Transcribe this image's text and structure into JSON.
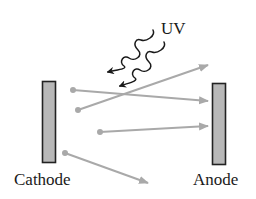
{
  "diagram": {
    "labels": {
      "uv": "UV",
      "cathode": "Cathode",
      "anode": "Anode"
    },
    "colors": {
      "plate_fill": "#b8b8b8",
      "plate_stroke": "#222222",
      "electron": "#a9a9a9",
      "photon": "#1a1a1a",
      "text": "#1a1a1a"
    },
    "electrons": [
      {
        "from": [
          73,
          90
        ],
        "to": [
          208,
          101
        ]
      },
      {
        "from": [
          78,
          110
        ],
        "to": [
          208,
          65
        ]
      },
      {
        "from": [
          100,
          132
        ],
        "to": [
          208,
          126
        ]
      },
      {
        "from": [
          65,
          153
        ],
        "to": [
          148,
          183
        ]
      }
    ],
    "photons": [
      {
        "from": [
          153,
          30
        ],
        "to": [
          108,
          72
        ]
      },
      {
        "from": [
          164,
          42
        ],
        "to": [
          120,
          86
        ]
      }
    ]
  }
}
